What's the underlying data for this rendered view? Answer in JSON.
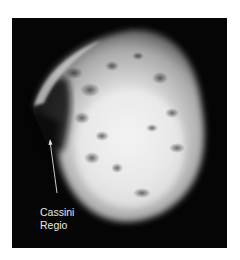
{
  "image": {
    "subject": "moon-surface-photo",
    "annotation": {
      "line1": "Cassini",
      "line2": "Regio"
    }
  }
}
